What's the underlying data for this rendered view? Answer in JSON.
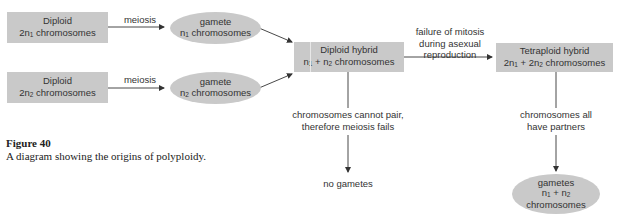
{
  "diagram": {
    "nodes": {
      "diploid1": {
        "line1": "Diploid",
        "line2_prefix": "2n",
        "line2_sub": "1",
        "line2_suffix": " chromosomes"
      },
      "diploid2": {
        "line1": "Diploid",
        "line2_prefix": "2n",
        "line2_sub": "2",
        "line2_suffix": " chromosomes"
      },
      "gamete1": {
        "line1": "gamete",
        "line2_prefix": "n",
        "line2_sub": "1",
        "line2_suffix": " chromosomes"
      },
      "gamete2": {
        "line1": "gamete",
        "line2_prefix": "n",
        "line2_sub": "2",
        "line2_suffix": " chromosomes"
      },
      "diploid_hybrid": {
        "line1": "Diploid hybrid",
        "a": "n",
        "a_sub": "1",
        "plus": " + ",
        "b": "n",
        "b_sub": "2",
        "suffix": " chromosomes"
      },
      "tetraploid_hybrid": {
        "line1": "Tetraploid hybrid",
        "a": "2n",
        "a_sub": "1",
        "plus": " + ",
        "b": "2n",
        "b_sub": "2",
        "suffix": " chromosomes"
      },
      "gametes_final": {
        "line1": "gametes",
        "a": "n",
        "a_sub": "1",
        "plus": " + ",
        "b": "n",
        "b_sub": "2",
        "line3": "chromosomes"
      },
      "no_gametes": "no gametes"
    },
    "edges": {
      "meiosis1": "meiosis",
      "meiosis2": "meiosis",
      "failure_mitosis": [
        "failure of mitosis",
        "during asexual",
        "reproduction"
      ],
      "cannot_pair": [
        "chromosomes cannot pair,",
        "therefore meiosis fails"
      ],
      "all_partners": [
        "chromosomes all",
        "have partners"
      ]
    },
    "colors": {
      "node_fill": "#c9c9c9",
      "line": "#333333"
    }
  },
  "caption": {
    "title": "Figure 40",
    "text": "A diagram showing the origins of polyploidy."
  }
}
